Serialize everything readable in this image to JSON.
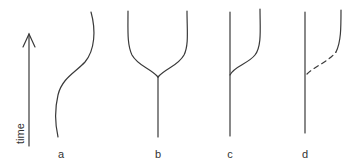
{
  "axis": {
    "label": "time",
    "direction": "up"
  },
  "panels": [
    {
      "id": "a",
      "label": "a",
      "description": "single lineage with gradual sigmoid change"
    },
    {
      "id": "b",
      "label": "b",
      "description": "lineage splitting into two diverging branches"
    },
    {
      "id": "c",
      "label": "c",
      "description": "unchanged lineage with a side branch diverging"
    },
    {
      "id": "d",
      "label": "d",
      "description": "unchanged lineage with a dashed (inferred) side branch"
    }
  ],
  "colors": {
    "line": "#3a3a3a",
    "text": "#333333",
    "background": "#ffffff"
  }
}
